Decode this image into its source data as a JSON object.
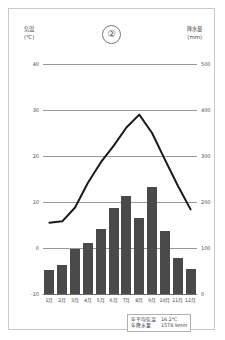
{
  "figure": {
    "number": "②"
  },
  "axes": {
    "left_title": "気温",
    "left_unit": "(℃)",
    "right_title": "降水量",
    "right_unit": "(mm)"
  },
  "annotation": {
    "mean_temp_label": "年平均気温",
    "mean_temp_value": "16.2℃",
    "annual_precip_label": "年降水量",
    "annual_precip_value": "1578.9mm"
  },
  "colors": {
    "bar": "#4a4a4a",
    "line": "#1a1a1a",
    "grid": "#9a9a9a",
    "border": "#c9c9c9"
  },
  "chart_data": {
    "type": "bar",
    "title": "",
    "xlabel": "",
    "ylabel": "気温 (℃)",
    "categories": [
      "1月",
      "2月",
      "3月",
      "4月",
      "5月",
      "6月",
      "7月",
      "8月",
      "9月",
      "10月",
      "11月",
      "12月"
    ],
    "ylim": [
      -10,
      40
    ],
    "yticks": [
      -10,
      0,
      10,
      20,
      30,
      40
    ],
    "y2lim": [
      0,
      500
    ],
    "y2ticks": [
      0,
      100,
      200,
      300,
      400,
      500
    ],
    "grid": true,
    "legend": "none",
    "series": [
      {
        "name": "降水量",
        "type": "bar",
        "axis": "right",
        "unit": "mm",
        "values": [
          52,
          62,
          98,
          110,
          142,
          188,
          212,
          165,
          232,
          136,
          78,
          54
        ]
      },
      {
        "name": "気温",
        "type": "line",
        "axis": "left",
        "unit": "℃",
        "values": [
          5.5,
          5.8,
          8.8,
          14.2,
          18.6,
          22.2,
          26.2,
          29.0,
          25.0,
          19.2,
          13.6,
          8.4
        ]
      }
    ]
  }
}
